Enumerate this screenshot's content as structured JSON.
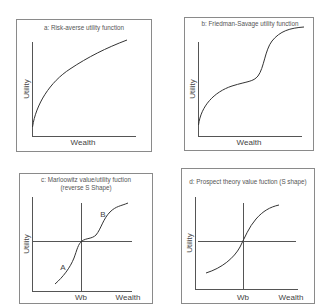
{
  "figure": {
    "panels": [
      {
        "id": "a",
        "title": "a: Risk-averse utility function",
        "ylabel": "Utility",
        "xlabel": "Wealth"
      },
      {
        "id": "b",
        "title": "b: Friedman-Savage utility function",
        "ylabel": "Utility",
        "xlabel": "Wealth"
      },
      {
        "id": "c",
        "title_line1": "c: Marloowitz value/utility fuction",
        "title_line2": "(reverse S Shape)",
        "ylabel": "Utility",
        "xlabel": "Wealth",
        "x_tick": "Wb",
        "point_labels": [
          "A",
          "B"
        ]
      },
      {
        "id": "d",
        "title": "d: Prospect theory value fuction (S shape)",
        "ylabel": "Utility",
        "xlabel": "Wealth",
        "x_tick": "Wb"
      }
    ]
  },
  "colors": {
    "box": "#8a8a8a",
    "axis": "#555555",
    "curve": "#333333",
    "text": "#444444"
  }
}
